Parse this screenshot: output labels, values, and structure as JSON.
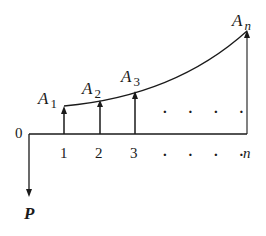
{
  "diagram": {
    "type": "cash-flow-diagram",
    "origin_label": "0",
    "present_value_label": "P",
    "periods": [
      "1",
      "2",
      "3",
      "n"
    ],
    "period_ellipsis": ". . . .",
    "payments": [
      {
        "symbol": "A",
        "subscript": "1"
      },
      {
        "symbol": "A",
        "subscript": "2"
      },
      {
        "symbol": "A",
        "subscript": "3"
      },
      {
        "symbol": "A",
        "subscript": "n"
      }
    ],
    "payment_ellipsis": ". . . .",
    "line_color": "#1a1a1a"
  }
}
